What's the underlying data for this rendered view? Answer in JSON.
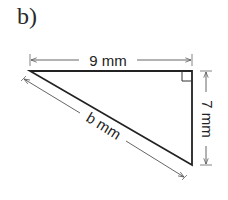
{
  "part_label": "b)",
  "figure": {
    "type": "right-triangle",
    "dimensions": {
      "top": "9 mm",
      "right": "7 mm",
      "hypotenuse": "b mm"
    },
    "right_angle_marker": "top-right",
    "colors": {
      "stroke": "#222222",
      "dimension_line": "#555555",
      "background": "#ffffff"
    }
  }
}
